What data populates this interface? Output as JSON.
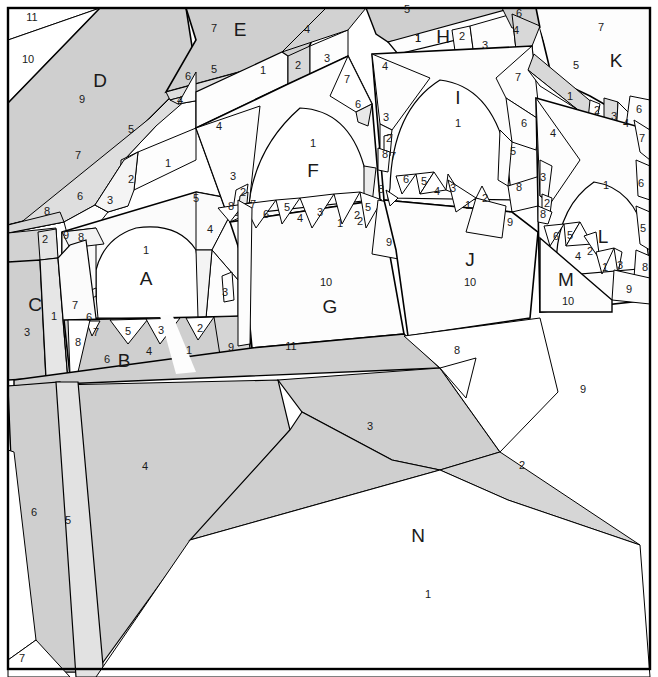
{
  "figure": {
    "kind": "polygon-nesting-diagram",
    "width": 658,
    "height": 677,
    "background": "#ffffff",
    "stroke": "#000000",
    "palette": {
      "white": "#ffffff",
      "near_white": "#fdfdfd",
      "light_gray": "#e8e8e8",
      "mid_gray": "#cfcfcf",
      "dark_gray": "#c2c2c2",
      "text": "#1a1a1a"
    }
  },
  "region_labels": [
    {
      "id": "A",
      "letter": "A",
      "number": "1",
      "x": 146,
      "y": 280,
      "nx": 146,
      "ny": 251
    },
    {
      "id": "B",
      "letter": "B",
      "number": "6",
      "x": 124,
      "y": 362,
      "nx": 107,
      "ny": 360
    },
    {
      "id": "C",
      "letter": "C",
      "number": "3",
      "x": 35,
      "y": 306,
      "nx": 27,
      "ny": 333
    },
    {
      "id": "D",
      "letter": "D",
      "number": "9",
      "x": 100,
      "y": 82,
      "nx": 82,
      "ny": 100
    },
    {
      "id": "E",
      "letter": "E",
      "number": "7",
      "x": 240,
      "y": 31,
      "nx": 214,
      "ny": 29
    },
    {
      "id": "F",
      "letter": "F",
      "number": "1",
      "x": 313,
      "y": 172,
      "nx": 313,
      "ny": 144
    },
    {
      "id": "G",
      "letter": "G",
      "number": "10",
      "x": 330,
      "y": 308,
      "nx": 326,
      "ny": 283
    },
    {
      "id": "H",
      "letter": "H",
      "number": "1",
      "x": 443,
      "y": 38,
      "nx": 418,
      "ny": 39
    },
    {
      "id": "I",
      "letter": "I",
      "number": "1",
      "x": 458,
      "y": 99,
      "nx": 458,
      "ny": 124
    },
    {
      "id": "J",
      "letter": "J",
      "number": "10",
      "x": 470,
      "y": 261,
      "nx": 470,
      "ny": 283
    },
    {
      "id": "K",
      "letter": "K",
      "number": "7",
      "x": 616,
      "y": 62,
      "nx": 601,
      "ny": 28
    },
    {
      "id": "L",
      "letter": "L",
      "number": "1",
      "x": 603,
      "y": 238,
      "nx": 606,
      "ny": 186
    },
    {
      "id": "M",
      "letter": "M",
      "number": "10",
      "x": 566,
      "y": 281,
      "nx": 568,
      "ny": 302
    },
    {
      "id": "N",
      "letter": "N",
      "number": "1",
      "x": 418,
      "y": 537,
      "nx": 428,
      "ny": 595
    }
  ],
  "numbers": [
    {
      "t": "11",
      "x": 32,
      "y": 18
    },
    {
      "t": "10",
      "x": 28,
      "y": 60
    },
    {
      "t": "5",
      "x": 131,
      "y": 130
    },
    {
      "t": "7",
      "x": 78,
      "y": 156
    },
    {
      "t": "6",
      "x": 80,
      "y": 197
    },
    {
      "t": "3",
      "x": 110,
      "y": 201
    },
    {
      "t": "2",
      "x": 131,
      "y": 180
    },
    {
      "t": "1",
      "x": 168,
      "y": 164
    },
    {
      "t": "8",
      "x": 47,
      "y": 212
    },
    {
      "t": "2",
      "x": 45,
      "y": 240
    },
    {
      "t": "9",
      "x": 66,
      "y": 236
    },
    {
      "t": "8",
      "x": 81,
      "y": 238
    },
    {
      "t": "1",
      "x": 54,
      "y": 317
    },
    {
      "t": "7",
      "x": 75,
      "y": 306
    },
    {
      "t": "6",
      "x": 89,
      "y": 318
    },
    {
      "t": "8",
      "x": 78,
      "y": 343
    },
    {
      "t": "7",
      "x": 96,
      "y": 333
    },
    {
      "t": "5",
      "x": 128,
      "y": 332
    },
    {
      "t": "4",
      "x": 149,
      "y": 352
    },
    {
      "t": "3",
      "x": 161,
      "y": 331
    },
    {
      "t": "1",
      "x": 189,
      "y": 351
    },
    {
      "t": "2",
      "x": 200,
      "y": 329
    },
    {
      "t": "9",
      "x": 231,
      "y": 348
    },
    {
      "t": "5",
      "x": 196,
      "y": 199
    },
    {
      "t": "4",
      "x": 210,
      "y": 230
    },
    {
      "t": "3",
      "x": 225,
      "y": 293
    },
    {
      "t": "6",
      "x": 188,
      "y": 77
    },
    {
      "t": "5",
      "x": 214,
      "y": 70
    },
    {
      "t": "4",
      "x": 180,
      "y": 101
    },
    {
      "t": "1",
      "x": 263,
      "y": 71
    },
    {
      "t": "2",
      "x": 298,
      "y": 66
    },
    {
      "t": "3",
      "x": 327,
      "y": 59
    },
    {
      "t": "4",
      "x": 307,
      "y": 30
    },
    {
      "t": "4",
      "x": 219,
      "y": 127
    },
    {
      "t": "3",
      "x": 233,
      "y": 177
    },
    {
      "t": "2",
      "x": 243,
      "y": 193
    },
    {
      "t": "8",
      "x": 231,
      "y": 207
    },
    {
      "t": "7",
      "x": 253,
      "y": 205
    },
    {
      "t": "6",
      "x": 266,
      "y": 215
    },
    {
      "t": "5",
      "x": 287,
      "y": 208
    },
    {
      "t": "4",
      "x": 300,
      "y": 219
    },
    {
      "t": "3",
      "x": 320,
      "y": 213
    },
    {
      "t": "1",
      "x": 340,
      "y": 224
    },
    {
      "t": "2",
      "x": 357,
      "y": 216
    },
    {
      "t": "9",
      "x": 389,
      "y": 243
    },
    {
      "t": "11",
      "x": 291,
      "y": 347
    },
    {
      "t": "7",
      "x": 347,
      "y": 80
    },
    {
      "t": "6",
      "x": 358,
      "y": 105
    },
    {
      "t": "3",
      "x": 386,
      "y": 118
    },
    {
      "t": "2",
      "x": 389,
      "y": 139
    },
    {
      "t": "8",
      "x": 385,
      "y": 155
    },
    {
      "t": "7",
      "x": 393,
      "y": 157
    },
    {
      "t": "8",
      "x": 381,
      "y": 190
    },
    {
      "t": "5",
      "x": 368,
      "y": 208
    },
    {
      "t": "2",
      "x": 360,
      "y": 222
    },
    {
      "t": "5",
      "x": 407,
      "y": 10
    },
    {
      "t": "1",
      "x": 418,
      "y": 39
    },
    {
      "t": "2",
      "x": 462,
      "y": 37
    },
    {
      "t": "3",
      "x": 485,
      "y": 46
    },
    {
      "t": "6",
      "x": 519,
      "y": 14
    },
    {
      "t": "4",
      "x": 516,
      "y": 31
    },
    {
      "t": "4",
      "x": 385,
      "y": 67
    },
    {
      "t": "7",
      "x": 518,
      "y": 78
    },
    {
      "t": "6",
      "x": 524,
      "y": 124
    },
    {
      "t": "5",
      "x": 513,
      "y": 152
    },
    {
      "t": "8",
      "x": 519,
      "y": 188
    },
    {
      "t": "6",
      "x": 406,
      "y": 180
    },
    {
      "t": "5",
      "x": 424,
      "y": 182
    },
    {
      "t": "4",
      "x": 437,
      "y": 192
    },
    {
      "t": "3",
      "x": 453,
      "y": 189
    },
    {
      "t": "1",
      "x": 468,
      "y": 206
    },
    {
      "t": "2",
      "x": 485,
      "y": 199
    },
    {
      "t": "9",
      "x": 510,
      "y": 223
    },
    {
      "t": "5",
      "x": 576,
      "y": 66
    },
    {
      "t": "1",
      "x": 570,
      "y": 97
    },
    {
      "t": "2",
      "x": 597,
      "y": 111
    },
    {
      "t": "3",
      "x": 614,
      "y": 117
    },
    {
      "t": "4",
      "x": 626,
      "y": 124
    },
    {
      "t": "6",
      "x": 639,
      "y": 110
    },
    {
      "t": "7",
      "x": 642,
      "y": 139
    },
    {
      "t": "6",
      "x": 641,
      "y": 184
    },
    {
      "t": "5",
      "x": 643,
      "y": 229
    },
    {
      "t": "4",
      "x": 553,
      "y": 134
    },
    {
      "t": "3",
      "x": 543,
      "y": 178
    },
    {
      "t": "2",
      "x": 547,
      "y": 204
    },
    {
      "t": "8",
      "x": 543,
      "y": 215
    },
    {
      "t": "6",
      "x": 556,
      "y": 237
    },
    {
      "t": "5",
      "x": 570,
      "y": 236
    },
    {
      "t": "4",
      "x": 578,
      "y": 257
    },
    {
      "t": "2",
      "x": 590,
      "y": 252
    },
    {
      "t": "1",
      "x": 605,
      "y": 268
    },
    {
      "t": "3",
      "x": 620,
      "y": 266
    },
    {
      "t": "8",
      "x": 645,
      "y": 268
    },
    {
      "t": "9",
      "x": 629,
      "y": 290
    },
    {
      "t": "8",
      "x": 457,
      "y": 351
    },
    {
      "t": "9",
      "x": 583,
      "y": 390
    },
    {
      "t": "3",
      "x": 370,
      "y": 427
    },
    {
      "t": "2",
      "x": 522,
      "y": 466
    },
    {
      "t": "4",
      "x": 145,
      "y": 467
    },
    {
      "t": "6",
      "x": 34,
      "y": 513
    },
    {
      "t": "5",
      "x": 68,
      "y": 521
    },
    {
      "t": "7",
      "x": 22,
      "y": 659
    }
  ]
}
